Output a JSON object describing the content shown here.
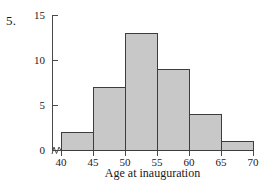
{
  "problem_number": "5.",
  "chart_data": {
    "type": "bar",
    "title": "",
    "subtitle": "",
    "xlabel": "Age at inauguration",
    "ylabel": "",
    "categories": [
      "40-45",
      "45-50",
      "50-55",
      "55-60",
      "60-65",
      "65-70"
    ],
    "bin_edges": [
      40,
      45,
      50,
      55,
      60,
      65,
      70
    ],
    "values": [
      2,
      7,
      13,
      9,
      4,
      1
    ],
    "bars": [
      {
        "label": "40-45",
        "start": 40,
        "end": 45,
        "value": 2
      },
      {
        "label": "45-50",
        "start": 45,
        "end": 50,
        "value": 7
      },
      {
        "label": "50-55",
        "start": 50,
        "end": 55,
        "value": 13
      },
      {
        "label": "55-60",
        "start": 55,
        "end": 60,
        "value": 9
      },
      {
        "label": "60-65",
        "start": 60,
        "end": 65,
        "value": 4
      },
      {
        "label": "65-70",
        "start": 65,
        "end": 70,
        "value": 1
      }
    ],
    "xlim": [
      40,
      70
    ],
    "ylim": [
      0,
      15
    ],
    "xticks": [
      40,
      45,
      50,
      55,
      60,
      65,
      70
    ],
    "xtick_labels": [
      "40",
      "45",
      "50",
      "55",
      "60",
      "65",
      "70"
    ],
    "yticks": [
      0,
      5,
      10,
      15
    ],
    "ytick_labels": [
      "0",
      "5",
      "10",
      "15"
    ],
    "grid": false,
    "legend": false,
    "legend_position": "none",
    "axis_break": true,
    "annotations": [],
    "colors": {
      "bar_fill": "#c8c8c8",
      "bar_edge": "#3d3d3d",
      "axis": "#4a4a4a",
      "text": "#1a1a1a",
      "background": "#ffffff"
    }
  }
}
